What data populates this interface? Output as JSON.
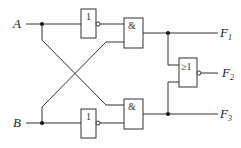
{
  "diagram": {
    "type": "logic-circuit",
    "inputs": [
      {
        "id": "A",
        "label": "A"
      },
      {
        "id": "B",
        "label": "B"
      }
    ],
    "gates": [
      {
        "id": "not_top",
        "symbol": "1",
        "type": "NOT"
      },
      {
        "id": "and_top",
        "symbol": "&",
        "type": "AND"
      },
      {
        "id": "not_bottom",
        "symbol": "1",
        "type": "NOT"
      },
      {
        "id": "and_bottom",
        "symbol": "&",
        "type": "AND"
      },
      {
        "id": "nor",
        "symbol": "≥1",
        "type": "NOR"
      }
    ],
    "outputs": [
      {
        "id": "F1",
        "label": "F",
        "sub": "1"
      },
      {
        "id": "F2",
        "label": "F",
        "sub": "2"
      },
      {
        "id": "F3",
        "label": "F",
        "sub": "3"
      }
    ]
  }
}
